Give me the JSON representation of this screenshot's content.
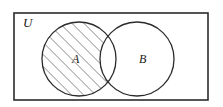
{
  "figure": {
    "background_color": "#ffffff",
    "stroke_color": "#2b2b2b",
    "hatch_color": "#3a3a3a",
    "width": 223,
    "height": 107
  },
  "universe": {
    "label": "U",
    "shape": "rectangle",
    "x": 14,
    "y": 13,
    "width": 194,
    "height": 87,
    "label_x": 23,
    "label_y": 24
  },
  "sets": [
    {
      "label": "A",
      "shape": "circle",
      "cx": 79,
      "cy": 59,
      "r": 37,
      "label_x": 72,
      "label_y": 60,
      "shaded": true
    },
    {
      "label": "B",
      "shape": "circle",
      "cx": 137,
      "cy": 59,
      "r": 37,
      "label_x": 139,
      "label_y": 60,
      "shaded": false
    }
  ],
  "shading": {
    "region_description": "A minus B",
    "pattern": "diagonal-hatch",
    "angle_degrees": 45,
    "spacing_px": 6,
    "color": "#3a3a3a"
  },
  "chart_data": {
    "type": "diagram",
    "diagram_type": "venn",
    "title": "",
    "universe_label": "U",
    "set_labels": [
      "A",
      "B"
    ],
    "shaded_region": "A \\ B",
    "regions": [
      {
        "name": "A only",
        "shaded": true
      },
      {
        "name": "A intersect B",
        "shaded": false
      },
      {
        "name": "B only",
        "shaded": false
      },
      {
        "name": "outside A and B",
        "shaded": false
      }
    ]
  }
}
